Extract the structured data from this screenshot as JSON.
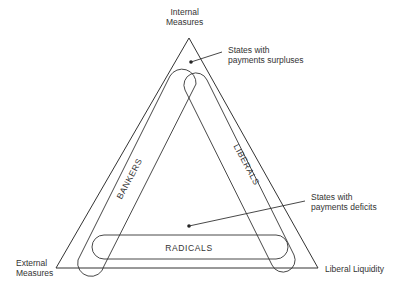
{
  "diagram": {
    "vertices": {
      "top": {
        "line1": "Internal",
        "line2": "Measures"
      },
      "bottom_left": {
        "line1": "External",
        "line2": "Measures"
      },
      "bottom_right": {
        "label": "Liberal Liquidity"
      }
    },
    "bands": {
      "left": "BANKERS",
      "right": "LIBERALS",
      "bottom": "RADICALS"
    },
    "annotations": {
      "surpluses": {
        "line1": "States with",
        "line2": "payments surpluses"
      },
      "deficits": {
        "line1": "States with",
        "line2": "payments deficits"
      }
    },
    "colors": {
      "line": "#333333",
      "background": "#ffffff"
    }
  }
}
